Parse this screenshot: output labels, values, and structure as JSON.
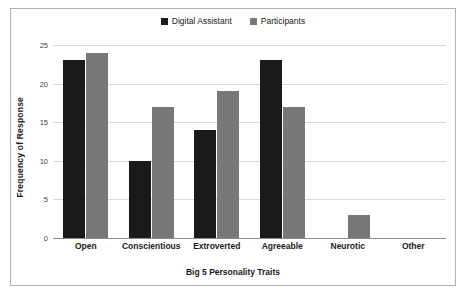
{
  "chart_data": {
    "type": "bar",
    "title": "",
    "xlabel": "Big 5 Personality Traits",
    "ylabel": "Frequency of Response",
    "categories": [
      "Open",
      "Conscientious",
      "Extroverted",
      "Agreeable",
      "Neurotic",
      "Other"
    ],
    "series": [
      {
        "name": "Digital Assistant",
        "color": "#1a1a1a",
        "values": [
          23,
          10,
          14,
          23,
          0,
          0
        ]
      },
      {
        "name": "Participants",
        "color": "#787878",
        "values": [
          24,
          17,
          19,
          17,
          3,
          0
        ]
      }
    ],
    "ylim": [
      0,
      25
    ],
    "yticks": [
      0,
      5,
      10,
      15,
      20,
      25
    ],
    "ytick_labels": [
      "0",
      "5",
      "10",
      "15",
      "20",
      "25"
    ],
    "grid": true,
    "legend_position": "top-center"
  },
  "figure": {
    "border_color": "#b0b0b0",
    "background": "#ffffff",
    "gridline_color": "#d9d9d9",
    "axis_color": "#8a8a8a"
  }
}
